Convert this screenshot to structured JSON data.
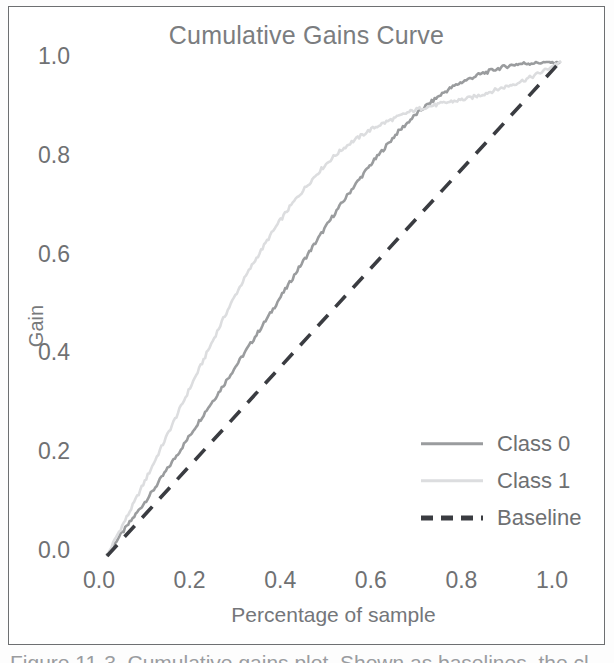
{
  "figure": {
    "caption": "Figure 11-3. Cumulative gains plot. Shown as baselines, the cl..."
  },
  "chart_data": {
    "type": "line",
    "title": "Cumulative Gains Curve",
    "xlabel": "Percentage of sample",
    "ylabel": "Gain",
    "xlim": [
      0.0,
      1.0
    ],
    "ylim": [
      0.0,
      1.0
    ],
    "xticks": [
      "0.0",
      "0.2",
      "0.4",
      "0.6",
      "0.8",
      "1.0"
    ],
    "yticks": [
      "0.0",
      "0.2",
      "0.4",
      "0.6",
      "0.8",
      "1.0"
    ],
    "xtick_values": [
      0.0,
      0.2,
      0.4,
      0.6,
      0.8,
      1.0
    ],
    "ytick_values": [
      0.0,
      0.2,
      0.4,
      0.6,
      0.8,
      1.0
    ],
    "grid": false,
    "legend_position": "lower right",
    "series": [
      {
        "name": "Class 0",
        "color": "#9a9c9e",
        "style": "solid",
        "x": [
          0.0,
          0.02,
          0.04,
          0.06,
          0.08,
          0.1,
          0.12,
          0.14,
          0.16,
          0.18,
          0.2,
          0.22,
          0.24,
          0.26,
          0.28,
          0.3,
          0.32,
          0.34,
          0.36,
          0.38,
          0.4,
          0.42,
          0.44,
          0.46,
          0.48,
          0.5,
          0.52,
          0.54,
          0.56,
          0.58,
          0.6,
          0.62,
          0.64,
          0.66,
          0.68,
          0.7,
          0.72,
          0.74,
          0.76,
          0.78,
          0.8,
          0.82,
          0.84,
          0.86,
          0.88,
          0.9,
          0.92,
          0.94,
          0.96,
          0.98,
          1.0
        ],
        "y": [
          0.0,
          0.03,
          0.055,
          0.08,
          0.105,
          0.13,
          0.158,
          0.185,
          0.212,
          0.24,
          0.268,
          0.296,
          0.322,
          0.35,
          0.378,
          0.406,
          0.434,
          0.462,
          0.49,
          0.52,
          0.548,
          0.578,
          0.606,
          0.634,
          0.662,
          0.69,
          0.716,
          0.742,
          0.766,
          0.79,
          0.812,
          0.834,
          0.856,
          0.874,
          0.892,
          0.908,
          0.922,
          0.936,
          0.948,
          0.958,
          0.966,
          0.974,
          0.98,
          0.986,
          0.991,
          0.995,
          0.997,
          0.998,
          0.999,
          1.0,
          1.0
        ]
      },
      {
        "name": "Class 1",
        "color": "#dcdddf",
        "style": "solid",
        "x": [
          0.0,
          0.02,
          0.04,
          0.06,
          0.08,
          0.1,
          0.12,
          0.14,
          0.16,
          0.18,
          0.2,
          0.22,
          0.24,
          0.26,
          0.28,
          0.3,
          0.32,
          0.34,
          0.36,
          0.38,
          0.4,
          0.42,
          0.44,
          0.46,
          0.48,
          0.5,
          0.52,
          0.54,
          0.56,
          0.58,
          0.6,
          0.62,
          0.64,
          0.66,
          0.68,
          0.7,
          0.72,
          0.74,
          0.76,
          0.78,
          0.8,
          0.82,
          0.84,
          0.86,
          0.88,
          0.9,
          0.92,
          0.94,
          0.96,
          0.98,
          1.0
        ],
        "y": [
          0.0,
          0.038,
          0.072,
          0.108,
          0.145,
          0.182,
          0.22,
          0.258,
          0.296,
          0.334,
          0.372,
          0.41,
          0.448,
          0.486,
          0.522,
          0.556,
          0.588,
          0.618,
          0.648,
          0.676,
          0.702,
          0.726,
          0.748,
          0.77,
          0.79,
          0.808,
          0.824,
          0.838,
          0.85,
          0.862,
          0.872,
          0.88,
          0.888,
          0.896,
          0.903,
          0.908,
          0.912,
          0.916,
          0.92,
          0.923,
          0.927,
          0.932,
          0.938,
          0.944,
          0.95,
          0.956,
          0.963,
          0.971,
          0.98,
          0.99,
          1.0
        ]
      },
      {
        "name": "Baseline",
        "color": "#3a3c41",
        "style": "dashed",
        "x": [
          0.0,
          1.0
        ],
        "y": [
          0.0,
          1.0
        ]
      }
    ]
  }
}
